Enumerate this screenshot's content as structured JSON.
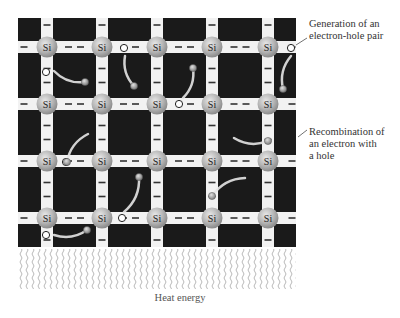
{
  "atom_label": "Si",
  "grid": {
    "cols": 5,
    "rows": 4,
    "x": [
      47,
      102,
      157,
      212,
      268
    ],
    "y": [
      47,
      104,
      161,
      218
    ],
    "bounds": {
      "left": 18,
      "top": 18,
      "right": 296,
      "bottom": 247
    }
  },
  "labels": {
    "generation": {
      "line1": "Generation of an",
      "line2": "electron-hole pair"
    },
    "recombination": {
      "line1": "Recombination of",
      "line2": "an electron with",
      "line3": "a hole"
    },
    "heat": "Heat energy"
  },
  "holes": [
    {
      "x": 291,
      "y": 48
    },
    {
      "x": 46,
      "y": 72
    },
    {
      "x": 124,
      "y": 48
    },
    {
      "x": 179,
      "y": 104
    },
    {
      "x": 66,
      "y": 162
    },
    {
      "x": 122,
      "y": 218
    },
    {
      "x": 46,
      "y": 235
    }
  ],
  "electrons": [
    {
      "x": 283,
      "y": 89,
      "tail": [
        291,
        56
      ]
    },
    {
      "x": 85,
      "y": 82,
      "tail": [
        54,
        71
      ]
    },
    {
      "x": 134,
      "y": 86,
      "tail": [
        125,
        56
      ]
    },
    {
      "x": 193,
      "y": 68,
      "tail": [
        183,
        98
      ]
    },
    {
      "x": 268,
      "y": 141,
      "tail": [
        234,
        138
      ]
    },
    {
      "x": 67,
      "y": 162,
      "tail": [
        88,
        134
      ]
    },
    {
      "x": 212,
      "y": 196,
      "tail": [
        245,
        178
      ]
    },
    {
      "x": 139,
      "y": 177,
      "tail": [
        124,
        212
      ]
    },
    {
      "x": 87,
      "y": 230,
      "tail": [
        54,
        235
      ]
    }
  ],
  "colors": {
    "background": "#1a1a1a",
    "bond": "#f2f2f2",
    "atom": "#b8b8b8",
    "electron": "#9a9a9a",
    "text": "#333333"
  }
}
